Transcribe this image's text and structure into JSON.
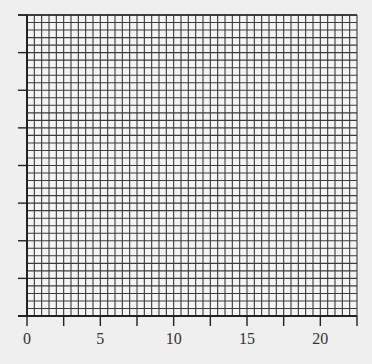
{
  "chart_data": {
    "type": "line",
    "title": "",
    "xlabel": "",
    "ylabel": "",
    "x_tick_labels": [
      "0",
      "5",
      "10",
      "15",
      "20"
    ],
    "x_tick_values": [
      0,
      5,
      10,
      15,
      20
    ],
    "x_minor_tick_step": 2.5,
    "xlim": [
      0,
      22.5
    ],
    "y_tick_count": 8,
    "y_tick_labels": [],
    "grid": true,
    "grid_columns": 45,
    "grid_rows": 40,
    "series": []
  },
  "colors": {
    "background": "#efefef",
    "grid_fill": "#f4f4f4",
    "grid_line": "#3a3a3a",
    "axis": "#222222",
    "text": "#333333"
  },
  "layout": {
    "plot_left": 27,
    "plot_right": 357,
    "plot_top": 15,
    "plot_bottom": 316
  }
}
